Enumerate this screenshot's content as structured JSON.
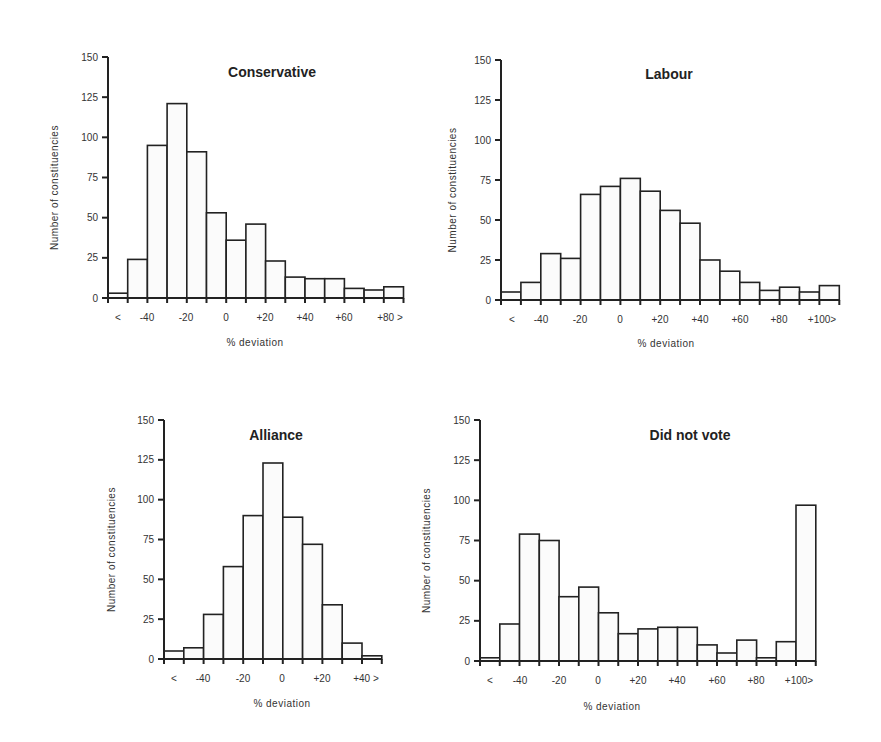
{
  "chart_data": [
    {
      "type": "bar",
      "title": "Conservative",
      "xlabel": "% deviation",
      "ylabel": "Number of constituencies",
      "ylim": [
        0,
        150
      ],
      "yticks": [
        0,
        25,
        50,
        75,
        100,
        125,
        150
      ],
      "bin_edges": [
        "<",
        -50,
        -40,
        -30,
        -20,
        -10,
        0,
        10,
        20,
        30,
        40,
        50,
        60,
        70,
        80,
        90,
        ">"
      ],
      "categories": [
        "<-50",
        "-50 to -40",
        "-40 to -30",
        "-30 to -20",
        "-20 to -10",
        "-10 to 0",
        "0 to 10",
        "10 to 20",
        "20 to 30",
        "30 to 40",
        "40 to 50",
        "50 to 60",
        "60 to 70",
        "70 to 80",
        "80 to 90"
      ],
      "values": [
        3,
        24,
        95,
        121,
        91,
        53,
        36,
        46,
        23,
        13,
        12,
        12,
        6,
        5,
        7
      ],
      "xtick_labels": [
        "<",
        "-40",
        "-20",
        "0",
        "+20",
        "+40",
        "+60",
        "+80 >"
      ],
      "grid": false
    },
    {
      "type": "bar",
      "title": "Labour",
      "xlabel": "% deviation",
      "ylabel": "Number of constituencies",
      "ylim": [
        0,
        150
      ],
      "yticks": [
        0,
        25,
        50,
        75,
        100,
        125,
        150
      ],
      "categories": [
        "<-50",
        "-50 to -40",
        "-40 to -30",
        "-30 to -20",
        "-20 to -10",
        "-10 to 0",
        "0 to 10",
        "10 to 20",
        "20 to 30",
        "30 to 40",
        "40 to 50",
        "50 to 60",
        "60 to 70",
        "70 to 80",
        "80 to 90",
        "90 to 100",
        "100 to 110"
      ],
      "values": [
        5,
        11,
        29,
        26,
        66,
        71,
        76,
        68,
        56,
        48,
        25,
        18,
        11,
        6,
        8,
        5,
        9
      ],
      "xtick_labels": [
        "<",
        "-40",
        "-20",
        "0",
        "+20",
        "+40",
        "+60",
        "+80",
        "+100>"
      ],
      "grid": false
    },
    {
      "type": "bar",
      "title": "Alliance",
      "xlabel": "% deviation",
      "ylabel": "Number of constituencies",
      "ylim": [
        0,
        150
      ],
      "yticks": [
        0,
        25,
        50,
        75,
        100,
        125,
        150
      ],
      "categories": [
        "<-50",
        "-50 to -40",
        "-40 to -30",
        "-30 to -20",
        "-20 to -10",
        "-10 to 0",
        "0 to 10",
        "10 to 20",
        "20 to 30",
        "30 to 40",
        "40 to 50"
      ],
      "values": [
        5,
        7,
        28,
        58,
        90,
        123,
        89,
        72,
        34,
        10,
        2
      ],
      "xtick_labels": [
        "<",
        "-40",
        "-20",
        "0",
        "+20",
        "+40 >"
      ],
      "grid": false
    },
    {
      "type": "bar",
      "title": "Did not vote",
      "xlabel": "% deviation",
      "ylabel": "Number of constituencies",
      "ylim": [
        0,
        150
      ],
      "yticks": [
        0,
        25,
        50,
        75,
        100,
        125,
        150
      ],
      "categories": [
        "<-50",
        "-50 to -40",
        "-40 to -30",
        "-30 to -20",
        "-20 to -10",
        "-10 to 0",
        "0 to 10",
        "10 to 20",
        "20 to 30",
        "30 to 40",
        "40 to 50",
        "50 to 60",
        "60 to 70",
        "70 to 80",
        "80 to 90",
        "90 to 100",
        "100 to 110"
      ],
      "values": [
        2,
        23,
        79,
        75,
        40,
        46,
        30,
        17,
        20,
        21,
        21,
        10,
        5,
        13,
        2,
        12,
        97
      ],
      "xtick_labels": [
        "<",
        "-40",
        "-20",
        "0",
        "+20",
        "+40",
        "+60",
        "+80",
        "+100>"
      ],
      "grid": false
    }
  ],
  "panels": [
    {
      "name": "conservative",
      "axis_x": 108,
      "baseline_y": 298,
      "top_y": 57,
      "bar_width": 19.7,
      "title_x": 272,
      "title_y": 77,
      "ylabel_x": 58,
      "xtick_positions": [
        118,
        147,
        186,
        226,
        265,
        305,
        344,
        390
      ],
      "xlabel_x": 255,
      "xlabel_y": 346
    },
    {
      "name": "labour",
      "axis_x": 501,
      "baseline_y": 300,
      "top_y": 60,
      "bar_width": 19.9,
      "title_x": 669,
      "title_y": 79,
      "ylabel_x": 456,
      "xtick_positions": [
        512,
        541,
        580,
        620,
        660,
        700,
        740,
        779,
        822
      ],
      "xlabel_x": 666,
      "xlabel_y": 347
    },
    {
      "name": "alliance",
      "axis_x": 164,
      "baseline_y": 659,
      "top_y": 420,
      "bar_width": 19.8,
      "title_x": 276,
      "title_y": 440,
      "ylabel_x": 115,
      "xtick_positions": [
        174,
        203,
        243,
        282,
        322,
        366
      ],
      "xlabel_x": 282,
      "xlabel_y": 707
    },
    {
      "name": "did-not-vote",
      "axis_x": 480,
      "baseline_y": 661,
      "top_y": 420,
      "bar_width": 19.75,
      "title_x": 690,
      "title_y": 440,
      "ylabel_x": 430,
      "xtick_positions": [
        490,
        520,
        559,
        598,
        638,
        677,
        717,
        756,
        799
      ],
      "xlabel_x": 612,
      "xlabel_y": 710
    }
  ]
}
